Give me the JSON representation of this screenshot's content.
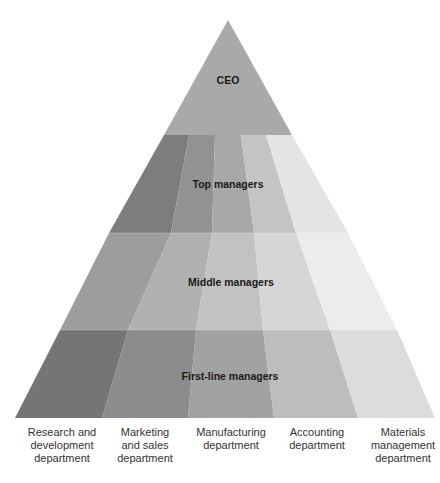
{
  "diagram": {
    "apex": {
      "label": "CEO",
      "color": "#a9a9a9"
    },
    "tiers": [
      {
        "label": "Top managers",
        "colors": [
          "#7d7d7d",
          "#929292",
          "#a8a8a8",
          "#c4c4c4",
          "#e4e4e4"
        ]
      },
      {
        "label": "Middle managers",
        "colors": [
          "#9d9d9d",
          "#b0b0b0",
          "#c2c2c2",
          "#d6d6d6",
          "#ececec"
        ]
      },
      {
        "label": "First-line managers",
        "colors": [
          "#757575",
          "#8c8c8c",
          "#a2a2a2",
          "#bdbdbd",
          "#dcdcdc"
        ]
      }
    ],
    "departments": [
      {
        "line1": "Research and",
        "line2": "development",
        "line3": "department"
      },
      {
        "line1": "Marketing",
        "line2": "and sales",
        "line3": "department"
      },
      {
        "line1": "Manufacturing",
        "line2": "department",
        "line3": ""
      },
      {
        "line1": "Accounting",
        "line2": "department",
        "line3": ""
      },
      {
        "line1": "Materials",
        "line2": "management",
        "line3": "department"
      }
    ]
  }
}
